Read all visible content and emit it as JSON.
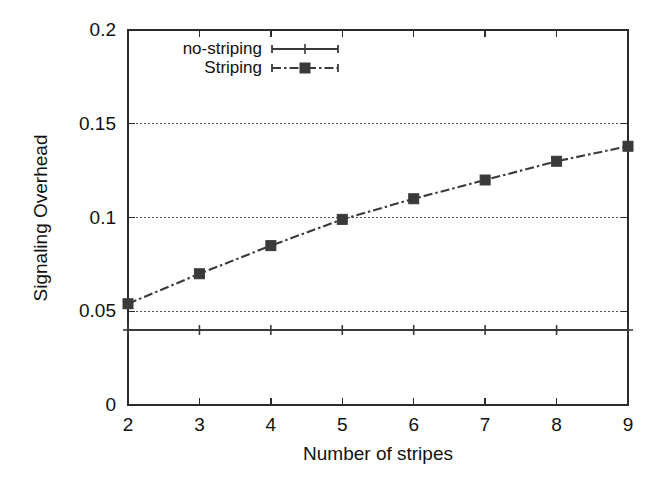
{
  "chart_data": {
    "type": "line",
    "title": "",
    "xlabel": "Number of stripes",
    "ylabel": "Signaling Overhead",
    "x": [
      2,
      3,
      4,
      5,
      6,
      7,
      8,
      9
    ],
    "xlim": [
      2,
      9
    ],
    "ylim": [
      0,
      0.2
    ],
    "xticks": [
      "2",
      "3",
      "4",
      "5",
      "6",
      "7",
      "8",
      "9"
    ],
    "yticks": [
      "0",
      "0.05",
      "0.1",
      "0.15",
      "0.2"
    ],
    "ytick_values": [
      0,
      0.05,
      0.1,
      0.15,
      0.2
    ],
    "grid": "horizontal-dotted",
    "legend_position": "top-center",
    "series": [
      {
        "name": "no-striping",
        "values": [
          0.04,
          0.04,
          0.04,
          0.04,
          0.04,
          0.04,
          0.04,
          0.04
        ],
        "line_style": "solid",
        "marker": "plus",
        "color": "#3a3a3a"
      },
      {
        "name": "Striping",
        "values": [
          0.054,
          0.07,
          0.085,
          0.099,
          0.11,
          0.12,
          0.13,
          0.138
        ],
        "line_style": "dash-dot",
        "marker": "filled-square",
        "color": "#3a3a3a"
      }
    ]
  },
  "axes": {
    "frame_color": "#2b2b2b",
    "grid_color": "#555555",
    "background": "#ffffff"
  },
  "legend": {
    "entries": [
      {
        "label": "no-striping"
      },
      {
        "label": "Striping"
      }
    ]
  }
}
